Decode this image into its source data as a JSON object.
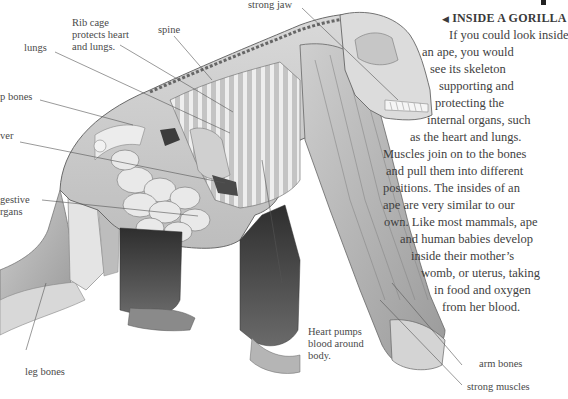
{
  "article": {
    "heading_marker": "◀",
    "heading": "INSIDE A GORILLA",
    "body_lines": [
      "If you could look inside",
      "an ape, you would",
      "see its skeleton",
      "supporting and",
      "protecting the",
      "internal organs, such",
      "as the heart and lungs.",
      "Muscles join on to the bones",
      "and pull them into different",
      "positions. The insides of an",
      "ape are very similar to our",
      "own. Like most mammals, ape",
      "and human babies develop",
      "inside their mother’s",
      "womb, or uterus, taking",
      "in food and oxygen",
      "from her blood."
    ]
  },
  "labels": {
    "strong_jaw": "strong jaw",
    "rib_cage": "Rib cage\nprotects heart\nand lungs.",
    "spine": "spine",
    "lungs": "lungs",
    "hip_bones": "p bones",
    "liver": "ver",
    "digestive_organs": "gestive\nrgans",
    "heart": "Heart pumps\nblood around\nbody.",
    "leg_bones": "leg bones",
    "arm_bones": "arm bones",
    "strong_muscles": "strong muscles"
  },
  "colors": {
    "background": "#ffffff",
    "text": "#3e3e3e",
    "leader_line": "#555555",
    "fur_dark": "#3a3a3a",
    "bone_light": "#e6e6e6",
    "shade_mid": "#b5b5b5"
  }
}
